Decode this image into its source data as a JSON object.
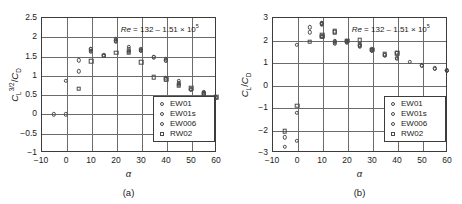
{
  "figure": {
    "panels": [
      {
        "id": "a",
        "subcaption": "(a)",
        "annotation": "Re = 132 – 1.51 × 10⁵",
        "annotation_parts": {
          "symbol": "Re",
          "rest": " = 132 – 1.51 × 10",
          "exp": "5"
        },
        "xlabel": "α",
        "ylabel": "C_L^{3/2}/C_D",
        "ylabel_parts": {
          "c1": "C",
          "sub1": "L",
          "sup1": "3/2",
          "slash": "/",
          "c2": "C",
          "sub2": "D"
        },
        "xticks": [
          "-10",
          "0",
          "10",
          "20",
          "30",
          "40",
          "50",
          "60"
        ],
        "yticks": [
          "2.5",
          "2",
          "1.5",
          "1",
          "0.5",
          "0",
          "-0.5",
          "-1"
        ],
        "legend": [
          {
            "label": "EW01",
            "marker": "circle"
          },
          {
            "label": "EW01s",
            "marker": "circle"
          },
          {
            "label": "EW006",
            "marker": "circle"
          },
          {
            "label": "RW02",
            "marker": "square"
          }
        ]
      },
      {
        "id": "b",
        "subcaption": "(b)",
        "annotation": "Re = 132 – 1.51 × 10⁵",
        "annotation_parts": {
          "symbol": "Re",
          "rest": " = 132 – 1.51 × 10",
          "exp": "5"
        },
        "xlabel": "α",
        "ylabel": "C_L/C_D",
        "ylabel_parts": {
          "c1": "C",
          "sub1": "L",
          "sup1": "",
          "slash": "/",
          "c2": "C",
          "sub2": "D"
        },
        "xticks": [
          "-10",
          "0",
          "10",
          "20",
          "30",
          "40",
          "50",
          "60"
        ],
        "yticks": [
          "3",
          "2",
          "1",
          "0",
          "-1",
          "-2",
          "-3"
        ],
        "legend": [
          {
            "label": "EW01",
            "marker": "circle"
          },
          {
            "label": "EW01s",
            "marker": "circle"
          },
          {
            "label": "EW006",
            "marker": "circle"
          },
          {
            "label": "RW02",
            "marker": "square"
          }
        ]
      }
    ]
  },
  "chart_data": [
    {
      "type": "scatter",
      "panel": "a",
      "title": "",
      "xlabel": "α",
      "ylabel": "C_L^{3/2}/C_D",
      "xlim": [
        -10,
        60
      ],
      "ylim": [
        -1,
        2.5
      ],
      "xticks": [
        -10,
        0,
        10,
        20,
        30,
        40,
        50,
        60
      ],
      "yticks": [
        -1,
        -0.5,
        0,
        0.5,
        1,
        1.5,
        2,
        2.5
      ],
      "grid": true,
      "legend_position": "lower right",
      "annotation": "Re = 132 – 1.51 × 10^5",
      "series": [
        {
          "name": "EW01",
          "marker": "circle",
          "points": [
            [
              -5,
              -0.02
            ],
            [
              0,
              -0.02
            ],
            [
              0,
              0.85
            ],
            [
              5,
              1.09
            ],
            [
              5,
              1.38
            ],
            [
              10,
              1.62
            ],
            [
              10,
              1.67
            ],
            [
              15,
              1.5
            ],
            [
              20,
              1.88
            ],
            [
              20,
              1.94
            ],
            [
              25,
              1.63
            ],
            [
              25,
              1.72
            ],
            [
              30,
              1.63
            ],
            [
              30,
              1.67
            ],
            [
              35,
              1.47
            ],
            [
              40,
              1.36
            ],
            [
              40,
              1.41
            ],
            [
              45,
              0.77
            ],
            [
              45,
              0.85
            ],
            [
              50,
              0.63
            ],
            [
              55,
              0.52
            ],
            [
              55,
              0.56
            ],
            [
              60,
              0.42
            ]
          ]
        },
        {
          "name": "EW01s",
          "marker": "circle",
          "points": [
            [
              10,
              1.6
            ],
            [
              15,
              1.51
            ],
            [
              20,
              1.86
            ],
            [
              25,
              1.6
            ],
            [
              30,
              1.62
            ],
            [
              40,
              0.88
            ],
            [
              40,
              0.92
            ],
            [
              45,
              0.74
            ],
            [
              50,
              0.62
            ],
            [
              55,
              0.5
            ]
          ]
        },
        {
          "name": "EW006",
          "marker": "circle",
          "points": [
            [
              10,
              1.66
            ],
            [
              20,
              1.9
            ],
            [
              25,
              1.66
            ],
            [
              30,
              1.65
            ],
            [
              35,
              1.46
            ],
            [
              40,
              1.38
            ],
            [
              45,
              0.8
            ],
            [
              55,
              0.54
            ],
            [
              60,
              0.41
            ]
          ]
        },
        {
          "name": "RW02",
          "marker": "square",
          "points": [
            [
              5,
              0.64
            ],
            [
              10,
              1.36
            ],
            [
              15,
              1.5
            ],
            [
              20,
              1.57
            ],
            [
              25,
              1.57
            ],
            [
              30,
              1.33
            ],
            [
              35,
              0.94
            ],
            [
              40,
              0.88
            ],
            [
              45,
              0.72
            ],
            [
              50,
              0.65
            ],
            [
              55,
              0.5
            ],
            [
              60,
              0.42
            ]
          ]
        }
      ]
    },
    {
      "type": "scatter",
      "panel": "b",
      "title": "",
      "xlabel": "α",
      "ylabel": "C_L/C_D",
      "xlim": [
        -10,
        60
      ],
      "ylim": [
        -3,
        3
      ],
      "xticks": [
        -10,
        0,
        10,
        20,
        30,
        40,
        50,
        60
      ],
      "yticks": [
        -3,
        -2,
        -1,
        0,
        1,
        2,
        3
      ],
      "grid": true,
      "legend_position": "lower right",
      "annotation": "Re = 132 – 1.51 × 10^5",
      "series": [
        {
          "name": "EW01",
          "marker": "circle",
          "points": [
            [
              -5,
              -2.35
            ],
            [
              -5,
              -2.78
            ],
            [
              0,
              -2.5
            ],
            [
              0,
              -1.25
            ],
            [
              0,
              1.77
            ],
            [
              5,
              2.32
            ],
            [
              5,
              2.55
            ],
            [
              10,
              2.7
            ],
            [
              10,
              2.73
            ],
            [
              10,
              2.12
            ],
            [
              15,
              1.82
            ],
            [
              15,
              1.95
            ],
            [
              20,
              1.88
            ],
            [
              20,
              1.92
            ],
            [
              25,
              1.7
            ],
            [
              25,
              1.78
            ],
            [
              30,
              1.52
            ],
            [
              30,
              1.58
            ],
            [
              35,
              1.32
            ],
            [
              40,
              1.15
            ],
            [
              40,
              1.4
            ],
            [
              45,
              1.0
            ],
            [
              50,
              0.85
            ],
            [
              55,
              0.72
            ],
            [
              60,
              0.62
            ]
          ]
        },
        {
          "name": "EW01s",
          "marker": "circle",
          "points": [
            [
              10,
              2.68
            ],
            [
              10,
              2.15
            ],
            [
              15,
              1.9
            ],
            [
              20,
              1.9
            ],
            [
              25,
              1.72
            ],
            [
              30,
              1.55
            ],
            [
              35,
              1.3
            ],
            [
              40,
              1.18
            ],
            [
              55,
              0.7
            ],
            [
              60,
              0.6
            ]
          ]
        },
        {
          "name": "EW006",
          "marker": "circle",
          "points": [
            [
              10,
              2.72
            ],
            [
              15,
              1.86
            ],
            [
              20,
              1.95
            ],
            [
              25,
              1.75
            ],
            [
              30,
              1.5
            ],
            [
              40,
              1.38
            ],
            [
              50,
              0.84
            ],
            [
              60,
              0.63
            ]
          ]
        },
        {
          "name": "RW02",
          "marker": "square",
          "points": [
            [
              -5,
              -2.08
            ],
            [
              0,
              -0.95
            ],
            [
              5,
              1.9
            ],
            [
              10,
              2.12
            ],
            [
              10,
              2.2
            ],
            [
              15,
              2.32
            ],
            [
              15,
              2.38
            ],
            [
              20,
              1.95
            ],
            [
              25,
              1.98
            ],
            [
              30,
              1.55
            ],
            [
              35,
              1.35
            ],
            [
              40,
              1.38
            ]
          ]
        }
      ]
    }
  ]
}
